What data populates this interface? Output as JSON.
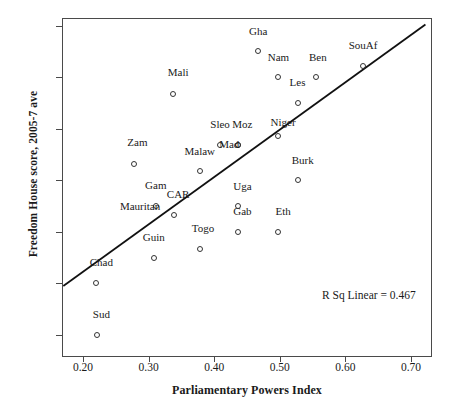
{
  "chart_data": {
    "type": "scatter",
    "title": "",
    "xlabel": "Parliamentary Powers Index",
    "ylabel": "Freedom House score, 2005-7 ave",
    "xlim": [
      0.168,
      0.732
    ],
    "ylim": [
      0.573,
      7.147
    ],
    "xticks": [
      "0.20",
      "0.30",
      "0.40",
      "0.50",
      "0.60",
      "0.70"
    ],
    "xtick_values": [
      0.2,
      0.3,
      0.4,
      0.5,
      0.6,
      0.7
    ],
    "yticks": [
      "7.00",
      "6.00",
      "5.00",
      "4.00",
      "3.00",
      "2.00",
      "1.00"
    ],
    "ytick_values": [
      7,
      6,
      5,
      4,
      3,
      2,
      1
    ],
    "grid": false,
    "legend": null,
    "marker": "open-circle",
    "points": [
      {
        "label": "Gha",
        "x": 0.467,
        "y": 6.5,
        "lx": 0.467,
        "ly": 6.78
      },
      {
        "label": "SouAf",
        "x": 0.627,
        "y": 6.22,
        "lx": 0.627,
        "ly": 6.5
      },
      {
        "label": "Nam",
        "x": 0.498,
        "y": 6.0,
        "lx": 0.498,
        "ly": 6.28
      },
      {
        "label": "Ben",
        "x": 0.555,
        "y": 6.0,
        "lx": 0.558,
        "ly": 6.28
      },
      {
        "label": "Mali",
        "x": 0.337,
        "y": 5.67,
        "lx": 0.345,
        "ly": 5.98
      },
      {
        "label": "Les",
        "x": 0.527,
        "y": 5.5,
        "lx": 0.527,
        "ly": 5.79
      },
      {
        "label": "Niger",
        "x": 0.498,
        "y": 4.85,
        "lx": 0.505,
        "ly": 5.02
      },
      {
        "label": "Sleo",
        "x": 0.409,
        "y": 4.68,
        "lx": 0.409,
        "ly": 4.97
      },
      {
        "label": "Moz",
        "x": 0.437,
        "y": 4.68,
        "lx": 0.443,
        "ly": 4.97
      },
      {
        "label": "Mad",
        "x": 0.437,
        "y": 4.68,
        "lx": 0.423,
        "ly": 4.58
      },
      {
        "label": "Zam",
        "x": 0.278,
        "y": 4.32,
        "lx": 0.283,
        "ly": 4.62
      },
      {
        "label": "Malaw",
        "x": 0.378,
        "y": 4.18,
        "lx": 0.378,
        "ly": 4.45
      },
      {
        "label": "Burk",
        "x": 0.528,
        "y": 4.0,
        "lx": 0.535,
        "ly": 4.28
      },
      {
        "label": "Uga",
        "x": 0.437,
        "y": 3.5,
        "lx": 0.443,
        "ly": 3.78
      },
      {
        "label": "Gam",
        "x": 0.311,
        "y": 3.5,
        "lx": 0.311,
        "ly": 3.8
      },
      {
        "label": "CAR",
        "x": 0.339,
        "y": 3.33,
        "lx": 0.345,
        "ly": 3.62
      },
      {
        "label": "Mauritan",
        "x": null,
        "y": null,
        "lx": 0.287,
        "ly": 3.38
      },
      {
        "label": "Gab",
        "x": 0.437,
        "y": 3.0,
        "lx": 0.443,
        "ly": 3.28
      },
      {
        "label": "Eth",
        "x": 0.498,
        "y": 3.0,
        "lx": 0.505,
        "ly": 3.28
      },
      {
        "label": "Togo",
        "x": 0.378,
        "y": 2.67,
        "lx": 0.383,
        "ly": 2.96
      },
      {
        "label": "Guin",
        "x": 0.308,
        "y": 2.5,
        "lx": 0.308,
        "ly": 2.79
      },
      {
        "label": "Chad",
        "x": 0.22,
        "y": 2.0,
        "lx": 0.228,
        "ly": 2.29
      },
      {
        "label": "Sud",
        "x": 0.222,
        "y": 1.0,
        "lx": 0.228,
        "ly": 1.3
      }
    ],
    "fit_line": {
      "type": "linear",
      "x_start": 0.17,
      "y_start": 1.95,
      "x_end": 0.722,
      "y_end": 7.02,
      "annotation": "R Sq Linear = 0.467",
      "r_squared": 0.467
    }
  }
}
